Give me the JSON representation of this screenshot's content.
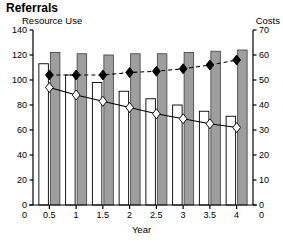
{
  "title": "Referrals",
  "axis_titles": {
    "left": "Resource Use",
    "right": "Costs",
    "x": "Year"
  },
  "colors": {
    "bar_gray_fill": "#9e9e9e",
    "bar_gray_stroke": "#4d4d4d",
    "bar_white_fill": "#ffffff",
    "bar_white_stroke": "#000000",
    "marker_filled": "#000000",
    "marker_open": "#ffffff",
    "axis": "#000000"
  },
  "chart_data": {
    "type": "bar",
    "title": "Referrals",
    "xlabel": "Year",
    "ylabel": "Resource Use",
    "y2label": "Costs",
    "ylim": [
      0,
      140
    ],
    "y2lim": [
      0,
      70
    ],
    "grid": false,
    "legend": "none",
    "categories": [
      "0.5",
      "1",
      "1.5",
      "2",
      "2.5",
      "3",
      "3.5",
      "4"
    ],
    "y_ticks": [
      "0",
      "20",
      "40",
      "60",
      "80",
      "100",
      "120",
      "140"
    ],
    "y2_ticks": [
      "0",
      "10",
      "20",
      "30",
      "40",
      "50",
      "60",
      "70"
    ],
    "series": [
      {
        "name": "Resource Use (open bar)",
        "type": "bar",
        "axis": "left",
        "style": "open",
        "values": [
          113,
          104,
          98,
          91,
          85,
          80,
          75,
          71
        ]
      },
      {
        "name": "Resource Use (gray bar)",
        "type": "bar",
        "axis": "left",
        "style": "gray",
        "values": [
          122,
          121,
          120,
          121,
          121,
          122,
          123,
          124
        ]
      },
      {
        "name": "Costs (filled diamond)",
        "type": "line",
        "axis": "right",
        "style": "dashed-filled-diamond",
        "values": [
          52,
          52,
          52,
          53,
          53.5,
          54.5,
          56,
          58
        ]
      },
      {
        "name": "Costs (open diamond)",
        "type": "line",
        "axis": "right",
        "style": "solid-open-diamond",
        "values": [
          47,
          44,
          41.5,
          39,
          36.5,
          34.5,
          32.5,
          31
        ]
      }
    ]
  }
}
